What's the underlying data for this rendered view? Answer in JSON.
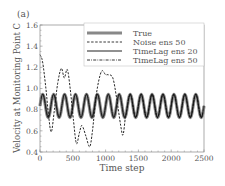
{
  "panel_label": "(a)",
  "chart_data": {
    "type": "line",
    "title": "",
    "xlabel": "Time step",
    "ylabel": "Velocity at Monitoring Point C",
    "xlim": [
      0,
      2500
    ],
    "ylim": [
      0.4,
      1.6
    ],
    "xticks": [
      0,
      500,
      1000,
      1500,
      2000,
      2500
    ],
    "xtick_labels": [
      "0",
      "500",
      "1000",
      "1500",
      "2000",
      "2500"
    ],
    "yticks": [
      0.4,
      0.6,
      0.8,
      1.0,
      1.2,
      1.4,
      1.6
    ],
    "ytick_labels": [
      "0.4",
      "0.6",
      "0.8",
      "1.0",
      "1.2",
      "1.4",
      "1.6"
    ],
    "grid": false,
    "legend_position": "upper right",
    "legend": [
      "True",
      "Noise ens 50",
      "TimeLag ens 20",
      "TimeLag ens 50"
    ],
    "true_signal": {
      "description": "periodic oscillation, ~15 cycles over 2500 steps",
      "period": 166.7,
      "mean": 0.835,
      "min": 0.725,
      "max": 0.945
    },
    "series": [
      {
        "name": "True",
        "style": "thick-gray",
        "x_step": 20.833,
        "cycle": [
          0.835,
          0.913,
          0.945,
          0.913,
          0.835,
          0.757,
          0.725,
          0.757
        ],
        "n_points": 121
      },
      {
        "name": "Noise ens 50",
        "style": "dashed",
        "points": [
          [
            0,
            1.32
          ],
          [
            40,
            1.25
          ],
          [
            90,
            1.0
          ],
          [
            130,
            0.75
          ],
          [
            172,
            0.59
          ],
          [
            220,
            0.8
          ],
          [
            270,
            1.05
          ],
          [
            325,
            1.19
          ],
          [
            370,
            1.1
          ],
          [
            416,
            1.18
          ],
          [
            460,
            1.0
          ],
          [
            510,
            0.7
          ],
          [
            555,
            0.48
          ],
          [
            600,
            0.58
          ],
          [
            640,
            0.65
          ],
          [
            700,
            0.55
          ],
          [
            757,
            0.45
          ],
          [
            800,
            0.6
          ],
          [
            860,
            0.95
          ],
          [
            935,
            1.16
          ],
          [
            1000,
            1.13
          ],
          [
            1037,
            1.13
          ],
          [
            1110,
            1.1
          ],
          [
            1170,
            0.9
          ],
          [
            1230,
            0.65
          ],
          [
            1265,
            0.56
          ],
          [
            1300,
            0.72
          ]
        ],
        "converges_to_true_after": 1300
      },
      {
        "name": "TimeLag ens 20",
        "style": "solid-black",
        "follows": "True",
        "offset": 0.0
      },
      {
        "name": "TimeLag ens 50",
        "style": "dash-dot",
        "follows": "True",
        "offset": 0.005
      }
    ]
  }
}
